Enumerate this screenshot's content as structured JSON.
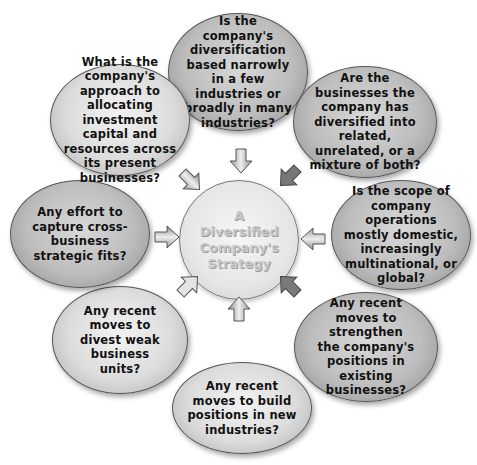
{
  "diagram": {
    "center": {
      "label": "A\nDiversified\nCompany's\nStrategy"
    },
    "nodes": [
      {
        "position": "top",
        "text": "Is the company's diversification based narrowly in a few industries or broadly in many industries?"
      },
      {
        "position": "top-right",
        "text": "Are the businesses the company has diversified into related, unrelated, or a mixture of both?"
      },
      {
        "position": "right",
        "text": "Is the scope of company operations mostly domestic, increasingly multinational, or global?"
      },
      {
        "position": "bottom-right",
        "text": "Any recent moves to strengthen the company's positions in existing businesses?"
      },
      {
        "position": "bottom",
        "text": "Any recent moves to build positions in new industries?"
      },
      {
        "position": "bottom-left",
        "text": "Any recent moves to divest weak business units?"
      },
      {
        "position": "left",
        "text": "Any effort to capture cross-business strategic fits?"
      },
      {
        "position": "top-left",
        "text": "What is the company's approach to allocating investment capital and resources across its present businesses?"
      }
    ],
    "arrows": [
      "top",
      "top-right",
      "right",
      "bottom-right",
      "bottom",
      "bottom-left",
      "left",
      "top-left"
    ],
    "colors": {
      "node_fill": "#bdbdbd",
      "node_border": "#555555",
      "center_fill": "#e6e6e6",
      "center_text": "#c8c8c8",
      "text": "#111111"
    }
  }
}
